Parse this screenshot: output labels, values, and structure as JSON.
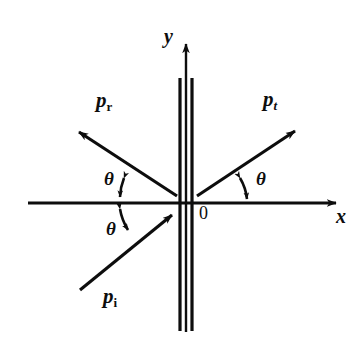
{
  "figure": {
    "background_color": "#ffffff",
    "stroke_color": "#0d0d0d",
    "width": 358,
    "height": 339
  },
  "axes": {
    "x_label": "x",
    "y_label": "y",
    "origin_label": "0",
    "x_axis": {
      "x1": 28,
      "y1": 203,
      "x2": 341,
      "y2": 203
    },
    "y_axis": {
      "x1": 186,
      "y1": 332,
      "x2": 186,
      "y2": 37
    }
  },
  "barrier": {
    "name": "potential-barrier",
    "line_left_x": 180,
    "line_right_x": 192,
    "y_top": 78,
    "y_bottom": 331,
    "line_width": 3
  },
  "vectors": [
    {
      "id": "incident",
      "label": "p",
      "subscript": "i",
      "subscript_italic": false,
      "label_x": 103,
      "label_y": 288,
      "tail": {
        "x": 80,
        "y": 290
      },
      "head": {
        "x": 176,
        "y": 211
      }
    },
    {
      "id": "reflected",
      "label": "p",
      "subscript": "r",
      "subscript_italic": false,
      "label_x": 96,
      "label_y": 92,
      "tail": {
        "x": 176,
        "y": 196
      },
      "head": {
        "x": 73,
        "y": 128
      }
    },
    {
      "id": "transmitted",
      "label": "p",
      "subscript": "t",
      "subscript_italic": true,
      "label_x": 263,
      "label_y": 91,
      "tail": {
        "x": 197,
        "y": 196
      },
      "head": {
        "x": 301,
        "y": 127
      }
    }
  ],
  "angles": [
    {
      "id": "theta-reflected",
      "label": "θ",
      "label_x": 105,
      "label_y": 170,
      "arc_center": {
        "x": 176,
        "y": 203
      },
      "arc_radius": 61,
      "start_deg": 180,
      "end_deg": 213
    },
    {
      "id": "theta-incident",
      "label": "θ",
      "label_x": 107,
      "label_y": 220,
      "arc_center": {
        "x": 176,
        "y": 203
      },
      "arc_radius": 61,
      "start_deg": 180,
      "end_deg": 141
    },
    {
      "id": "theta-transmitted",
      "label": "θ",
      "label_x": 256,
      "label_y": 170,
      "arc_center": {
        "x": 197,
        "y": 203
      },
      "arc_radius": 55,
      "start_deg": 0,
      "end_deg": 33
    }
  ]
}
